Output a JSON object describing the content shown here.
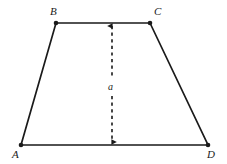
{
  "figure": {
    "kind": "geometry-diagram",
    "shape": "trapezoid",
    "background_color": "#ffffff",
    "stroke_color": "#1a1a1a",
    "vertices": [
      {
        "id": "A",
        "label": "A",
        "x": 21,
        "y": 145
      },
      {
        "id": "B",
        "label": "B",
        "x": 56,
        "y": 23
      },
      {
        "id": "C",
        "label": "C",
        "x": 150,
        "y": 23
      },
      {
        "id": "D",
        "label": "D",
        "x": 208,
        "y": 145
      }
    ],
    "edges": [
      {
        "from": "A",
        "to": "B"
      },
      {
        "from": "B",
        "to": "C"
      },
      {
        "from": "C",
        "to": "D"
      },
      {
        "from": "D",
        "to": "A"
      }
    ],
    "dimension": {
      "label": "a",
      "meaning": "height",
      "style": "dashed-double-arrow",
      "x": 112,
      "y_top": 23,
      "y_bottom": 145
    }
  }
}
